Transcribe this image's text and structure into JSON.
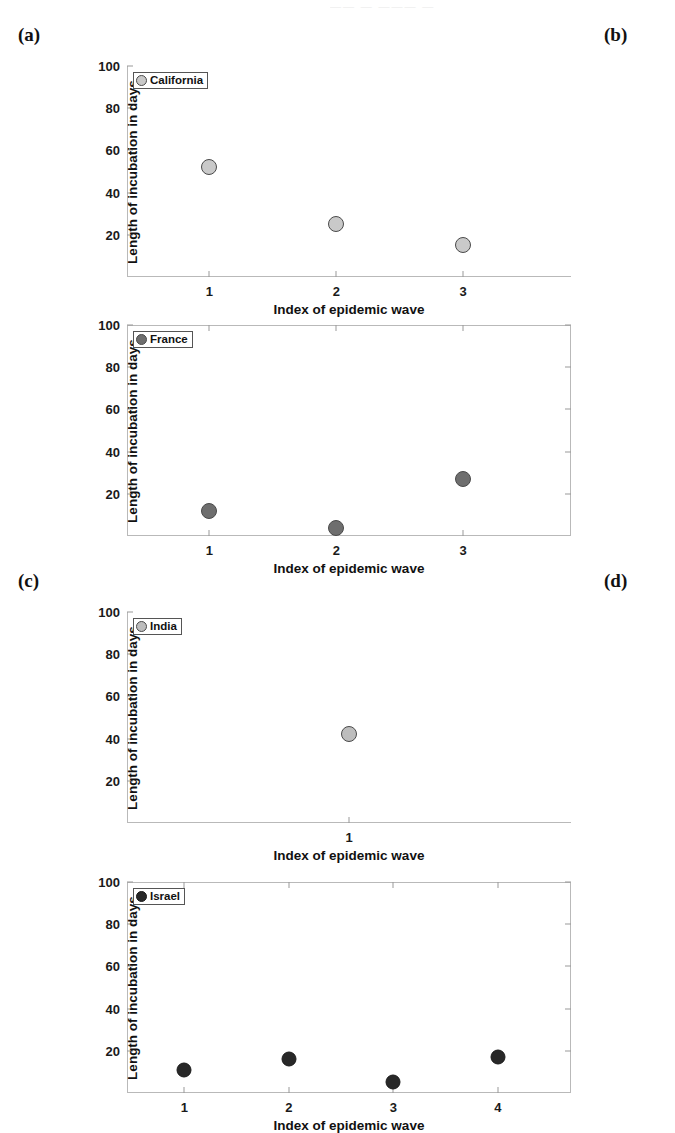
{
  "figure": {
    "top_crop_text": "——  —  ———  —",
    "panel_labels": {
      "a": "(a)",
      "b": "(b)",
      "c": "(c)",
      "d": "(d)"
    },
    "axis": {
      "xlabel": "Index of epidemic wave",
      "ylabel": "Length of incubation in days",
      "yticks": [
        20,
        40,
        60,
        80,
        100
      ],
      "ylim": [
        0,
        100
      ]
    },
    "colors": {
      "california": "#c9c9c9",
      "france": "#6e6e6e",
      "india": "#bdbdbd",
      "israel": "#282828",
      "marker_edge": "#4a4a4a",
      "axis_line": "#b9b9b9",
      "text": "#111111"
    }
  },
  "chart_data": [
    {
      "id": "california",
      "panel": "(a)",
      "type": "scatter",
      "title": "California",
      "legend": "California",
      "xlabel": "Index of epidemic wave",
      "ylabel": "Length of incubation in days",
      "xticks": [
        1,
        2,
        3
      ],
      "xlim": [
        0.35,
        3.85
      ],
      "yticks": [
        20,
        40,
        60,
        80,
        100
      ],
      "ylim": [
        0,
        100
      ],
      "grid": false,
      "marker_color": "#c9c9c9",
      "x": [
        1,
        2,
        3
      ],
      "values": [
        52,
        25,
        15
      ],
      "points": [
        {
          "x": 1,
          "y": 52
        },
        {
          "x": 2,
          "y": 25
        },
        {
          "x": 3,
          "y": 15
        }
      ]
    },
    {
      "id": "france",
      "panel": "(b)",
      "type": "scatter",
      "title": "France",
      "legend": "France",
      "xlabel": "Index of epidemic wave",
      "ylabel": "Length of incubation in days",
      "xticks": [
        1,
        2,
        3
      ],
      "xlim": [
        0.35,
        3.85
      ],
      "yticks": [
        20,
        40,
        60,
        80,
        100
      ],
      "ylim": [
        0,
        100
      ],
      "grid": false,
      "marker_color": "#6e6e6e",
      "x": [
        1,
        2,
        3
      ],
      "values": [
        12,
        4,
        27
      ],
      "points": [
        {
          "x": 1,
          "y": 12
        },
        {
          "x": 2,
          "y": 4
        },
        {
          "x": 3,
          "y": 27
        }
      ]
    },
    {
      "id": "india",
      "panel": "(c)",
      "type": "scatter",
      "title": "India",
      "legend": "India",
      "xlabel": "Index of epidemic wave",
      "ylabel": "Length of incubation in days",
      "xticks": [
        1
      ],
      "xlim": [
        0.3,
        1.7
      ],
      "yticks": [
        20,
        40,
        60,
        80,
        100
      ],
      "ylim": [
        0,
        100
      ],
      "grid": false,
      "marker_color": "#bdbdbd",
      "x": [
        1
      ],
      "values": [
        42
      ],
      "points": [
        {
          "x": 1,
          "y": 42
        }
      ]
    },
    {
      "id": "israel",
      "panel": "(d)",
      "type": "scatter",
      "title": "Israel",
      "legend": "Israel",
      "xlabel": "Index of epidemic wave",
      "ylabel": "Length of incubation in days",
      "xticks": [
        1,
        2,
        3,
        4
      ],
      "xlim": [
        0.45,
        4.7
      ],
      "yticks": [
        20,
        40,
        60,
        80,
        100
      ],
      "ylim": [
        0,
        100
      ],
      "grid": false,
      "marker_color": "#282828",
      "x": [
        1,
        2,
        3,
        4
      ],
      "values": [
        11,
        16,
        5,
        17
      ],
      "points": [
        {
          "x": 1,
          "y": 11
        },
        {
          "x": 2,
          "y": 16
        },
        {
          "x": 3,
          "y": 5
        },
        {
          "x": 4,
          "y": 17
        }
      ]
    }
  ]
}
